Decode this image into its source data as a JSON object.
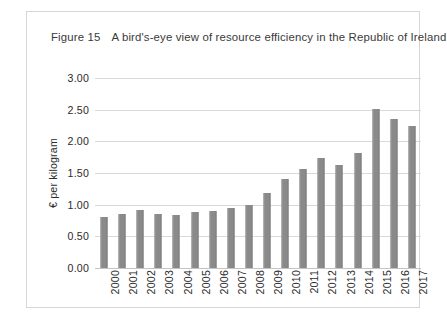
{
  "figure": {
    "number": "Figure 15",
    "title": "A bird's-eye view of resource efficiency in the Republic of Ireland"
  },
  "colors": {
    "bar": "#8a8a8a",
    "gridline": "#d9d9d9",
    "frame": "#d6d6d6",
    "text": "#2b2b2b"
  },
  "chart_data": {
    "type": "bar",
    "title": "A bird's-eye view of resource efficiency in the Republic of Ireland",
    "xlabel": "",
    "ylabel": "€ per kilogram",
    "categories": [
      "2000",
      "2001",
      "2002",
      "2003",
      "2004",
      "2005",
      "2006",
      "2007",
      "2008",
      "2009",
      "2010",
      "2011",
      "2012",
      "2013",
      "2014",
      "2015",
      "2016",
      "2017"
    ],
    "values": [
      0.8,
      0.86,
      0.92,
      0.85,
      0.84,
      0.89,
      0.9,
      0.95,
      0.99,
      1.19,
      1.41,
      1.57,
      1.74,
      1.63,
      1.82,
      2.51,
      2.36,
      2.25
    ],
    "ylim": [
      0,
      3.0
    ],
    "ytick_labels": [
      "0.00",
      "0.50",
      "1.00",
      "1.50",
      "2.00",
      "2.50",
      "3.00"
    ],
    "ytick_values": [
      0,
      0.5,
      1.0,
      1.5,
      2.0,
      2.5,
      3.0
    ],
    "grid": true,
    "legend": false
  }
}
